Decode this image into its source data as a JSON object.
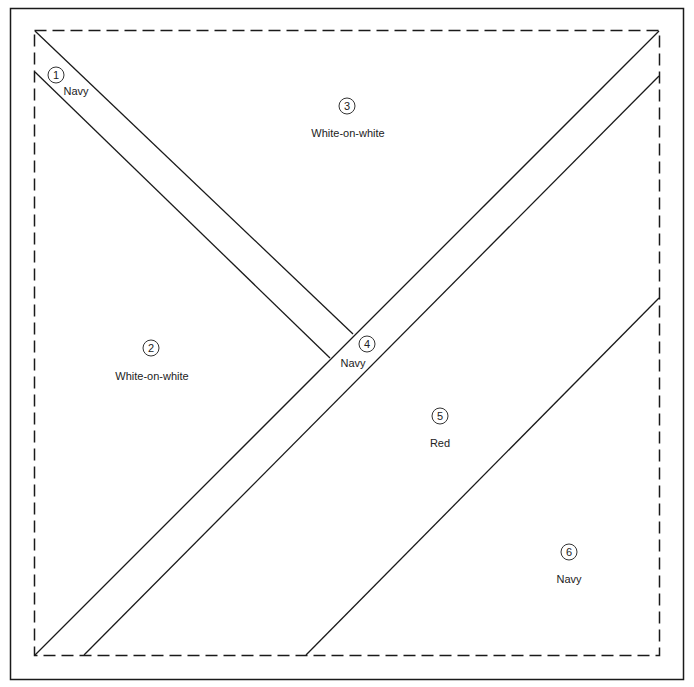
{
  "diagram": {
    "line_color": "#1a1a1a",
    "pieces": [
      {
        "number": "1",
        "fabric": "Navy"
      },
      {
        "number": "2",
        "fabric": "White-on-white"
      },
      {
        "number": "3",
        "fabric": "White-on-white"
      },
      {
        "number": "4",
        "fabric": "Navy"
      },
      {
        "number": "5",
        "fabric": "Red"
      },
      {
        "number": "6",
        "fabric": "Navy"
      }
    ]
  }
}
